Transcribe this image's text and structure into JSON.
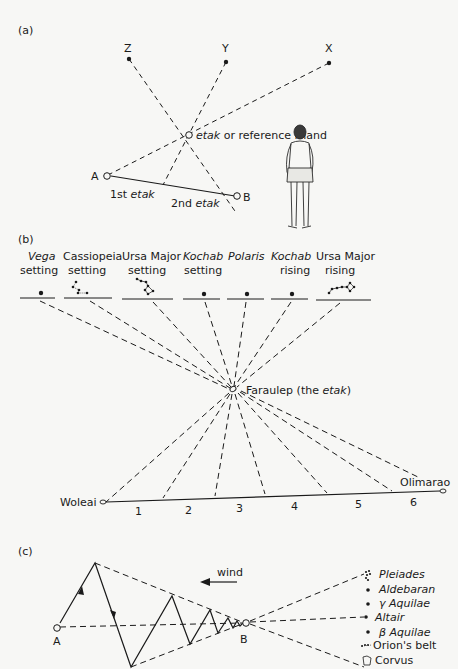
{
  "figure": {
    "panels": {
      "a": {
        "label": "(a)",
        "stars": [
          "Z",
          "Y",
          "X"
        ],
        "etak_label": "etak",
        "etak_suffix": " or reference island",
        "point_a": "A",
        "point_b": "B",
        "first_etak_prefix": "1st ",
        "first_etak_word": "etak",
        "second_etak_prefix": "2nd ",
        "second_etak_word": "etak"
      },
      "b": {
        "label": "(b)",
        "star_points": [
          {
            "name": "Vega",
            "italic": true,
            "state": "setting"
          },
          {
            "name": "Cassiopeia",
            "italic": false,
            "state": "setting"
          },
          {
            "name": "Ursa Major",
            "italic": false,
            "state": "setting"
          },
          {
            "name": "Kochab",
            "italic": true,
            "state": "setting"
          },
          {
            "name": "Polaris",
            "italic": true,
            "state": ""
          },
          {
            "name": "Kochab",
            "italic": true,
            "state": "rising"
          },
          {
            "name": "Ursa Major",
            "italic": false,
            "state": "rising"
          }
        ],
        "etak_island": "Faraulep (the ",
        "etak_word": "etak",
        "etak_close": ")",
        "origin": "Woleai",
        "destination": "Olimarao",
        "segments": [
          "1",
          "2",
          "3",
          "4",
          "5",
          "6"
        ]
      },
      "c": {
        "label": "(c)",
        "wind_label": "wind",
        "point_a": "A",
        "point_b": "B",
        "stars": [
          "Pleiades",
          "Aldebaran",
          "γ Aquilae",
          "Altair",
          "β Aquilae",
          "Orion's belt",
          "Corvus"
        ]
      }
    }
  }
}
